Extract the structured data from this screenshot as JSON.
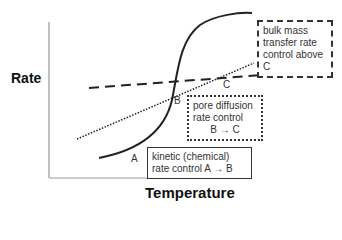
{
  "axes": {
    "y_label": "Rate",
    "x_label": "Temperature"
  },
  "points": {
    "A": "A",
    "B": "B",
    "C": "C"
  },
  "boxes": {
    "bulk": {
      "lines": [
        "bulk mass",
        "transfer rate",
        "control above C"
      ]
    },
    "pore": {
      "lines": [
        "pore diffusion",
        "rate control",
        "B → C"
      ]
    },
    "kinetic": {
      "lines": [
        "kinetic (chemical)",
        "rate control  A → B"
      ]
    }
  },
  "curves": {
    "kinetic_curve": "solid sigmoid",
    "pore_diffusion_line": "dotted",
    "bulk_mass_transfer_line": "dashed"
  },
  "colors": {
    "line": "#222222",
    "text": "#333333"
  }
}
